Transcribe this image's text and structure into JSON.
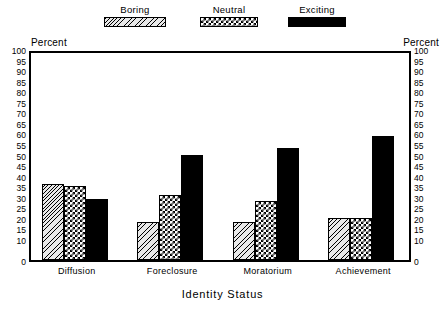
{
  "chart_data": {
    "type": "bar",
    "title": "",
    "xlabel": "Identity Status",
    "ylabel": "Percent",
    "ylabel_right": "Percent",
    "ylim": [
      0,
      100
    ],
    "ytick_step": 5,
    "yticks": [
      100,
      95,
      90,
      85,
      80,
      75,
      70,
      65,
      60,
      55,
      50,
      45,
      40,
      35,
      30,
      25,
      20,
      15,
      10,
      0
    ],
    "grid": false,
    "legend_position": "top",
    "categories": [
      "Diffusion",
      "Foreclosure",
      "Moratorium",
      "Achievement"
    ],
    "series": [
      {
        "name": "Boring",
        "pattern": "diagonal-hatch",
        "values": [
          36,
          18,
          18,
          20
        ]
      },
      {
        "name": "Neutral",
        "pattern": "checkerboard",
        "values": [
          35,
          31,
          28,
          20
        ]
      },
      {
        "name": "Exciting",
        "pattern": "solid-black",
        "values": [
          29,
          50,
          53,
          59
        ]
      }
    ]
  },
  "legend": {
    "items": [
      {
        "label": "Boring",
        "swatch": "hatch-swatch"
      },
      {
        "label": "Neutral",
        "swatch": "checker-swatch"
      },
      {
        "label": "Exciting",
        "swatch": "solid-swatch"
      }
    ]
  },
  "axes": {
    "left_title": "Percent",
    "right_title": "Percent",
    "x_title": "Identity Status"
  },
  "colors": {
    "foreground": "#000000",
    "background": "#ffffff",
    "hatch_fill": "#e8e8e8"
  }
}
